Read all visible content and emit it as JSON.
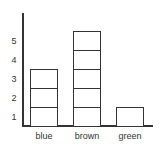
{
  "chart_data": {
    "type": "bar",
    "style": "unit-stacked boxes (each box = 1 unit)",
    "title": "",
    "xlabel": "",
    "ylabel": "",
    "categories": [
      "blue",
      "brown",
      "green"
    ],
    "values": [
      3,
      5,
      1
    ],
    "yticks": [
      "1",
      "2",
      "3",
      "4",
      "5"
    ],
    "ylim": [
      0,
      6
    ],
    "grid": false,
    "legend": null,
    "bar_fill": "#ffffff",
    "bar_stroke": "#333333"
  },
  "layout": {
    "origin_x": 23,
    "baseline_y": 126,
    "axis_top_y": 13,
    "axis_right_x": 153,
    "unit_px": 19,
    "bar_width": 28,
    "bar_lefts": [
      30,
      73,
      116
    ]
  }
}
